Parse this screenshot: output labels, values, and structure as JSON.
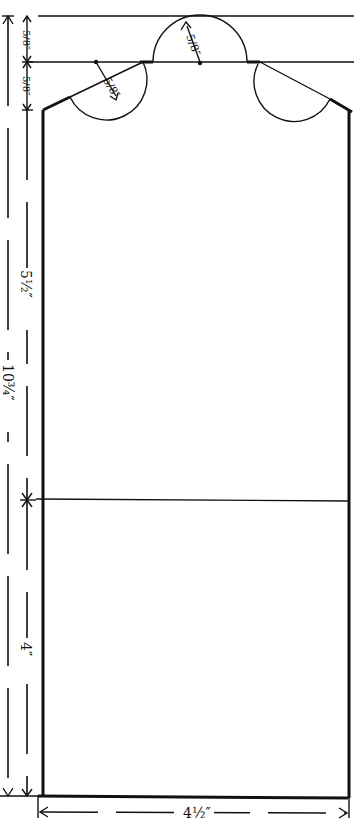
{
  "diagram": {
    "type": "sewing-pattern",
    "stroke_color": "#111111",
    "background": "#ffffff",
    "dimensions": {
      "top_section_1": "5/8″",
      "top_section_2": "5/8″",
      "upper_body": "5½″",
      "total_height": "10¾″",
      "lower_body": "4″",
      "width": "4½″",
      "center_arc_radius": "5/8″",
      "left_arc_radius": "5/8″"
    }
  }
}
